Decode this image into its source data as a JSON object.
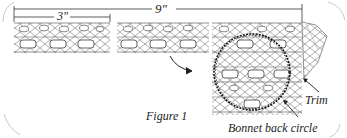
{
  "figure": {
    "caption": "Figure 1",
    "dimension_total": "9\"",
    "dimension_segment": "3\"",
    "labels": {
      "trim": "Trim",
      "circle": "Bonnet back circle"
    },
    "colors": {
      "ink": "#222222",
      "lace": "#8a8a8a",
      "frame": "#c8c8c8",
      "background": "#ffffff"
    }
  }
}
